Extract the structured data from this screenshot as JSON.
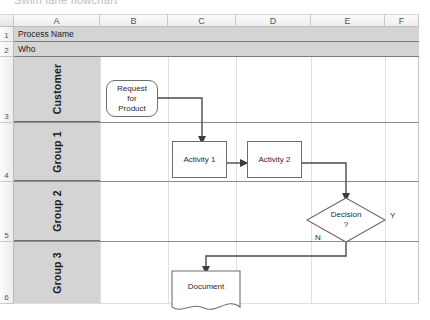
{
  "title_strip": "Swim lane flowchart",
  "spreadsheet": {
    "columns": [
      "A",
      "B",
      "C",
      "D",
      "E",
      "F"
    ],
    "rows": [
      "1",
      "2",
      "3",
      "4",
      "5",
      "6"
    ],
    "info_rows": [
      {
        "row": "1",
        "value": "Process Name"
      },
      {
        "row": "2",
        "value": "Who"
      }
    ]
  },
  "lanes": [
    {
      "row": "3",
      "label": "Customer"
    },
    {
      "row": "4",
      "label": "Group 1"
    },
    {
      "row": "5",
      "label": "Group 2"
    },
    {
      "row": "6",
      "label": "Group 3"
    }
  ],
  "flowchart": {
    "shapes": [
      {
        "id": "request",
        "type": "rounded-rectangle",
        "text": "Request\nfor\nProduct",
        "lane": "Customer"
      },
      {
        "id": "activity1",
        "type": "rectangle",
        "text": "Activity 1",
        "lane": "Group 1"
      },
      {
        "id": "activity2",
        "type": "rectangle",
        "text": "Activity 2",
        "lane": "Group 1"
      },
      {
        "id": "decision",
        "type": "diamond",
        "text": "Decision\n?",
        "lane": "Group 2"
      },
      {
        "id": "document",
        "type": "document",
        "text": "Document",
        "lane": "Group 3"
      }
    ],
    "shape_text": {
      "request_l1": "Request",
      "request_l2": "for",
      "request_l3": "Product",
      "activity1": "Activity 1",
      "activity2": "Activity 2",
      "decision_l1": "Decision",
      "decision_l2": "?",
      "document": "Document"
    },
    "branch_labels": {
      "yes": "Y",
      "no": "N"
    },
    "colors": {
      "shape_border": "#6e6e6e",
      "shape_fill": "#ffffff",
      "connector": "#4a4a4a",
      "lane_header_fill": "#d4d4d4",
      "grid_line": "#dfdfdf"
    }
  }
}
